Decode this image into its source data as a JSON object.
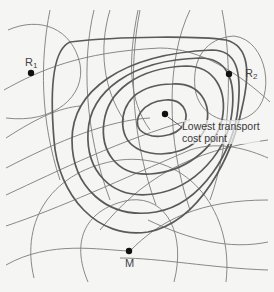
{
  "diagram": {
    "type": "isodapane transport-cost map",
    "points": [
      {
        "id": "R1",
        "label": "R",
        "subscript": "1",
        "x": 31,
        "y": 73
      },
      {
        "id": "R2",
        "label": "R",
        "subscript": "2",
        "x": 229,
        "y": 74
      },
      {
        "id": "M",
        "label": "M",
        "subscript": "",
        "x": 129,
        "y": 251
      },
      {
        "id": "optimum",
        "label": "Lowest transport cost point",
        "x": 165,
        "y": 114
      }
    ],
    "annotation": {
      "line1": "Lowest transport",
      "line2": "cost point"
    },
    "colors": {
      "background": "#f5f5f4",
      "thin_lines": "#7c7c7c",
      "thick_contours": "#5a5a5a",
      "points": "#111111",
      "text": "#444444"
    }
  },
  "labels": {
    "r1_base": "R",
    "r1_sub": "1",
    "r2_base": "R",
    "r2_sub": "2",
    "m": "M",
    "callout_line1": "Lowest transport",
    "callout_line2": "cost point"
  }
}
